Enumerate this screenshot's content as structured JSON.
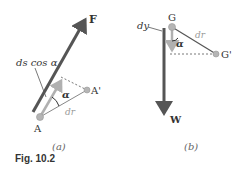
{
  "figure": {
    "caption": "Fig. 10.2",
    "colors": {
      "dark_vector": "#555555",
      "light_vector": "#b0b0b0",
      "point": "#b5b5b5",
      "text": "#333333",
      "light_text": "#999999"
    }
  },
  "panel_a": {
    "label": "(a)",
    "force_label": "F",
    "point_start": "A",
    "point_end": "A'",
    "projection_label": "ds cos α",
    "angle_label": "α",
    "displacement_label": "dr"
  },
  "panel_b": {
    "label": "(b)",
    "weight_label": "W",
    "point_start": "G",
    "point_end": "G'",
    "vertical_label": "dy",
    "angle_label": "α",
    "displacement_label": "dr"
  }
}
